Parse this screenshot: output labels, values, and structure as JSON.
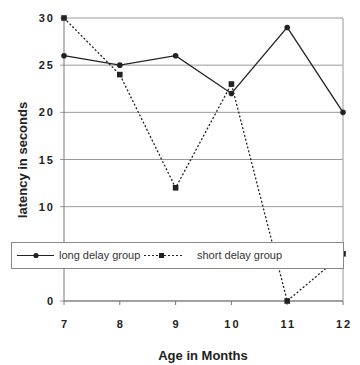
{
  "chart_data": {
    "type": "line",
    "title": "",
    "xlabel": "Age in Months",
    "ylabel": "latency in seconds",
    "x": [
      7,
      8,
      9,
      10,
      11,
      12
    ],
    "x_tick_labels": [
      "7",
      "8",
      "9",
      "10",
      "11",
      "12"
    ],
    "y_tick_labels": [
      "0",
      "5",
      "10",
      "15",
      "20",
      "25",
      "30"
    ],
    "y_ticks_shown": [
      "0",
      "10",
      "15",
      "20",
      "25",
      "30"
    ],
    "ylim": [
      0,
      30
    ],
    "xlim": [
      7,
      12
    ],
    "grid": "horizontal",
    "legend_position": "inside, lower-middle",
    "series": [
      {
        "name": "long delay group",
        "values": [
          26,
          25,
          26,
          22,
          29,
          20
        ],
        "line_style": "solid",
        "marker": "circle",
        "color": "#222222"
      },
      {
        "name": "short delay group",
        "values": [
          30,
          24,
          12,
          23,
          0,
          5
        ],
        "line_style": "dotted",
        "marker": "square",
        "color": "#222222"
      }
    ]
  },
  "legend": {
    "items": [
      {
        "label": "long delay group"
      },
      {
        "label": "short delay group"
      }
    ]
  },
  "axes": {
    "x_title": "Age in Months",
    "y_title": "latency in seconds"
  }
}
